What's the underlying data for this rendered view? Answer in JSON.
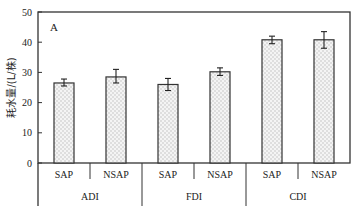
{
  "chart_data": {
    "type": "bar",
    "panel_label": "A",
    "title": "",
    "xlabel": "",
    "ylabel": "耗水量/(L/株)",
    "ylim": [
      0,
      50
    ],
    "yticks": [
      0,
      10,
      20,
      30,
      40,
      50
    ],
    "grid": false,
    "legend": null,
    "groups": [
      "ADI",
      "FDI",
      "CDI"
    ],
    "categories": [
      "SAP",
      "NSAP",
      "SAP",
      "NSAP",
      "SAP",
      "NSAP"
    ],
    "group_of_category": [
      "ADI",
      "ADI",
      "FDI",
      "FDI",
      "CDI",
      "CDI"
    ],
    "values": [
      26.5,
      28.5,
      26.0,
      30.2,
      40.8,
      40.8
    ],
    "error_low": [
      25.5,
      26.5,
      24.0,
      29.0,
      39.5,
      38.0
    ],
    "error_high": [
      27.8,
      31.0,
      28.0,
      31.5,
      42.0,
      43.5
    ],
    "bar_fill": "dotted-light-gray",
    "colors": {
      "bar_edge": "#333333",
      "bar_fill": "#f2f2f2",
      "dots": "#b5b5b5",
      "axis": "#333333"
    }
  }
}
